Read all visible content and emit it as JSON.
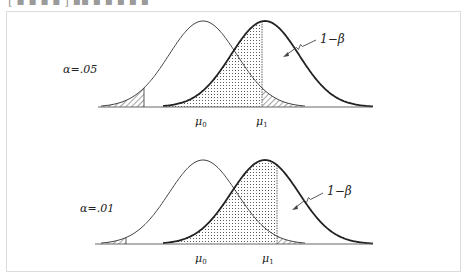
{
  "caption_fragment": "[ ▪ ▪ ▪ ▪ ] ▪▪ ▪ ▪ ▪ ▪ ▪",
  "panels": [
    {
      "id": "alpha-05",
      "alpha_label": "α=.05",
      "power_label": "1−β",
      "mu0_label": "μ",
      "mu0_sub": "0",
      "mu1_label": "μ",
      "mu1_sub": "1",
      "alpha": 0.05,
      "tails": "two-tailed"
    },
    {
      "id": "alpha-01",
      "alpha_label": "α=.01",
      "power_label": "1−β",
      "mu0_label": "μ",
      "mu0_sub": "0",
      "mu1_label": "μ",
      "mu1_sub": "1",
      "alpha": 0.01,
      "tails": "two-tailed"
    }
  ],
  "colors": {
    "curve": "#333333",
    "frame": "#dcdcdc",
    "baseline": "#555555"
  }
}
